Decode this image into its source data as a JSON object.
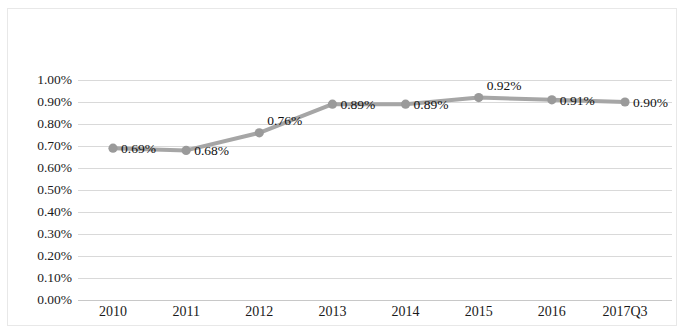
{
  "chart_data": {
    "type": "line",
    "title": "",
    "subtitle": "",
    "xlabel": "",
    "ylabel": "",
    "categories": [
      "2010",
      "2011",
      "2012",
      "2013",
      "2014",
      "2015",
      "2016",
      "2017Q3"
    ],
    "values": [
      0.69,
      0.68,
      0.76,
      0.89,
      0.89,
      0.92,
      0.91,
      0.9
    ],
    "point_labels": [
      "0.69%",
      "0.68%",
      "0.76%",
      "0.89%",
      "0.89%",
      "0.92%",
      "0.91%",
      "0.90%"
    ],
    "y_tick_labels": [
      "1.00%",
      "0.90%",
      "0.80%",
      "0.70%",
      "0.60%",
      "0.50%",
      "0.40%",
      "0.30%",
      "0.20%",
      "0.10%",
      "0.00%"
    ],
    "y_tick_values": [
      1.0,
      0.9,
      0.8,
      0.7,
      0.6,
      0.5,
      0.4,
      0.3,
      0.2,
      0.1,
      0.0
    ],
    "ylim": [
      0.0,
      1.0
    ],
    "y_unit": "%",
    "grid": true,
    "legend": false,
    "legend_position": "none",
    "series": [
      {
        "name": "",
        "values": [
          0.69,
          0.68,
          0.76,
          0.89,
          0.89,
          0.92,
          0.91,
          0.9
        ],
        "line_color": "#a6a6a6",
        "marker_color": "#9a9a9a"
      }
    ],
    "colors": {
      "line": "#a6a6a6",
      "marker": "#9a9a9a",
      "gridline": "#d9d9d9",
      "axis": "#c8c8c8",
      "border": "#e8e8e8",
      "text": "#1a1a1a",
      "background": "#ffffff"
    }
  }
}
